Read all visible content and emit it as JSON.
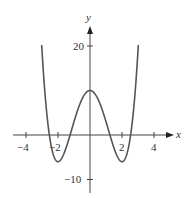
{
  "chart_data": {
    "type": "line",
    "title": "",
    "xlabel": "x",
    "ylabel": "y",
    "function": "y = x^4 - 8x^2 + 10",
    "xlim": [
      -5,
      5
    ],
    "ylim": [
      -13,
      24
    ],
    "x_ticks": [
      -4,
      -2,
      2,
      4
    ],
    "x_tick_labels": [
      "−4",
      "−2",
      "2",
      "4"
    ],
    "y_ticks": [
      20,
      -10
    ],
    "y_tick_labels": [
      "20",
      "−10"
    ],
    "grid": false,
    "series": [
      {
        "name": "f(x)",
        "x": [
          -3.02,
          -2.5,
          -2,
          -1.5,
          -1,
          -0.5,
          0,
          0.5,
          1,
          1.5,
          2,
          2.5,
          3.02
        ],
        "values": [
          20,
          -0.94,
          -6,
          -3.94,
          3,
          8.06,
          10,
          8.06,
          3,
          -3.94,
          -6,
          -0.94,
          20
        ]
      }
    ],
    "key_points": {
      "local_max": [
        0,
        10
      ],
      "local_min": [
        [
          -2,
          -6
        ],
        [
          2,
          -6
        ]
      ]
    },
    "color": "#555555"
  },
  "axes": {
    "x_label": "x",
    "y_label": "y"
  },
  "ticks": {
    "x": [
      {
        "value": -4,
        "label": "−4"
      },
      {
        "value": -2,
        "label": "−2"
      },
      {
        "value": 2,
        "label": "2"
      },
      {
        "value": 4,
        "label": "4"
      }
    ],
    "y": [
      {
        "value": 20,
        "label": "20"
      },
      {
        "value": -10,
        "label": "−10"
      }
    ]
  }
}
